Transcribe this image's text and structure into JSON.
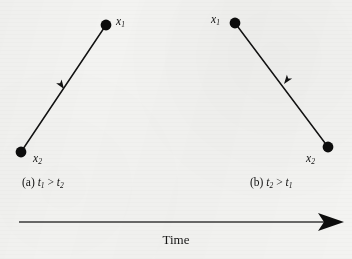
{
  "figure": {
    "background_color": "#f3f3f1",
    "ink_color": "#101010",
    "axis": {
      "label": "Time",
      "direction": "left-to-right",
      "arrow_start_x": 19,
      "arrow_end_x": 344,
      "arrow_y": 222
    },
    "panels": [
      {
        "id": "a",
        "caption_prefix": "(a)",
        "caption_lhs": "t",
        "caption_lhs_sub": "1",
        "caption_relation": ">",
        "caption_rhs": "t",
        "caption_rhs_sub": "2",
        "caption_full": "(a) t1 > t2",
        "arrow_direction": "up-right",
        "points": [
          {
            "label": "x",
            "sublabel": "1",
            "role": "head",
            "x": 106,
            "y": 25,
            "label_side": "right"
          },
          {
            "label": "x",
            "sublabel": "2",
            "role": "tail",
            "x": 21,
            "y": 152,
            "label_side": "right"
          }
        ]
      },
      {
        "id": "b",
        "caption_prefix": "(b)",
        "caption_lhs": "t",
        "caption_lhs_sub": "2",
        "caption_relation": ">",
        "caption_rhs": "t",
        "caption_rhs_sub": "1",
        "caption_full": "(b) t2 > t1",
        "arrow_direction": "up-left",
        "points": [
          {
            "label": "x",
            "sublabel": "1",
            "role": "head",
            "x": 235,
            "y": 23,
            "label_side": "left"
          },
          {
            "label": "x",
            "sublabel": "2",
            "role": "tail",
            "x": 328,
            "y": 147,
            "label_side": "left"
          }
        ]
      }
    ]
  }
}
